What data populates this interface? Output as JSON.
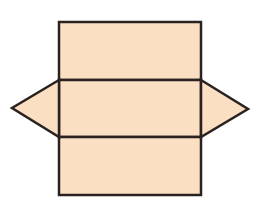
{
  "diagram": {
    "type": "net",
    "colors": {
      "fill": "#fbdfc3",
      "stroke": "#2a2220",
      "background": "#ffffff"
    },
    "stroke_width": 2.5,
    "shapes": [
      {
        "name": "top-rectangle",
        "kind": "rect",
        "x": 59,
        "y": 22,
        "w": 142,
        "h": 58
      },
      {
        "name": "middle-rectangle",
        "kind": "rect",
        "x": 59,
        "y": 80,
        "w": 142,
        "h": 57
      },
      {
        "name": "bottom-rectangle",
        "kind": "rect",
        "x": 59,
        "y": 137,
        "w": 142,
        "h": 58
      },
      {
        "name": "left-triangle",
        "kind": "polygon",
        "points": "59,80 12,108 59,137"
      },
      {
        "name": "right-triangle",
        "kind": "polygon",
        "points": "201,80 248,109 201,137"
      }
    ]
  }
}
